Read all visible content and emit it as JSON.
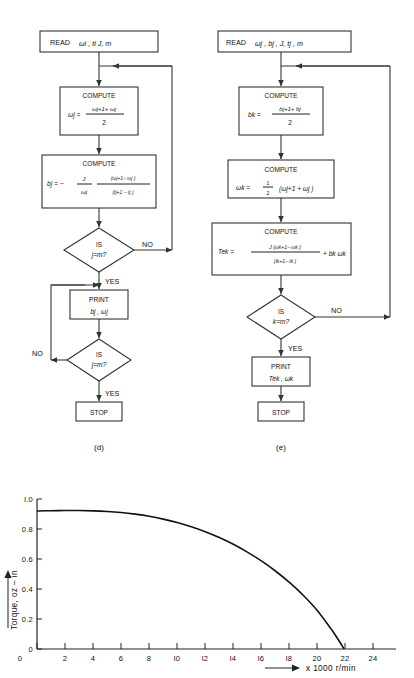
{
  "figure": {
    "panels": [
      {
        "id": "d",
        "caption": "(d)",
        "nodes": {
          "read": "READ",
          "read_args": "ωi , ti   J, m",
          "compute1_title": "COMPUTE",
          "compute1_lhs": "ωj =",
          "compute1_num": "ωj+1+ ωj",
          "compute1_den": "2",
          "compute2_title": "COMPUTE",
          "compute2_lhs": "bj = −",
          "compute2_f1_num": "J",
          "compute2_f1_den": "ωj",
          "compute2_f2_num": "(ωj+1− ωj )",
          "compute2_f2_den": "(tj+1 − tj )",
          "decision1_l1": "IS",
          "decision1_l2": "j=m?",
          "decision1_no": "NO",
          "decision1_yes": "YES",
          "print_title": "PRINT",
          "print_args": "bj , ωj",
          "decision2_l1": "IS",
          "decision2_l2": "j=m?",
          "decision2_no": "NO",
          "decision2_yes": "YES",
          "stop": "STOP"
        }
      },
      {
        "id": "e",
        "caption": "(e)",
        "nodes": {
          "read": "READ",
          "read_args": "ωj , bj ,  J,  tj , m",
          "compute1_title": "COMPUTE",
          "compute1_lhs": "bk =",
          "compute1_num": "bj+1+ bj",
          "compute1_den": "2",
          "compute2_title": "COMPUTE",
          "compute2_lhs": "ωk =",
          "compute2_half_num": "1",
          "compute2_half_den": "2",
          "compute2_rhs": "(ωj+1 + ωj )",
          "compute3_title": "COMPUTE",
          "compute3_lhs": "Tek =",
          "compute3_num": "J (ωk+1− ωk )",
          "compute3_den": "(tk+1− tk )",
          "compute3_tail": "+ bk ωk",
          "decision_l1": "IS",
          "decision_l2": "k=m?",
          "decision_no": "NO",
          "decision_yes": "YES",
          "print_title": "PRINT",
          "print_args": "Tek , ωk",
          "stop": "STOP"
        }
      }
    ]
  },
  "chart_data": {
    "type": "line",
    "title": "",
    "xlabel": "x 1000 r/min",
    "ylabel": "Torque, oz – in",
    "xlim": [
      0,
      25.6
    ],
    "ylim": [
      0,
      1.08
    ],
    "grid": false,
    "legend": null,
    "x_ticks": [
      0,
      2,
      4,
      6,
      8,
      10,
      12,
      14,
      16,
      18,
      20,
      22,
      24
    ],
    "x_tick_labels": [
      "0",
      "2",
      "4",
      "6",
      "8",
      "l0",
      "l2",
      "l4",
      "l6",
      "l8",
      "20",
      "22",
      "24"
    ],
    "y_ticks": [
      0,
      0.2,
      0.4,
      0.6,
      0.8,
      1.0
    ],
    "y_tick_labels": [
      "0",
      "0.2",
      "0.4",
      "0.6",
      "0.8",
      "l.0"
    ],
    "series": [
      {
        "name": "torque-speed curve",
        "x": [
          0,
          1,
          2,
          3,
          4,
          5,
          6,
          7,
          8,
          9,
          10,
          11,
          12,
          13,
          14,
          15,
          16,
          17,
          18,
          19,
          20,
          21,
          21.5,
          21.9
        ],
        "y": [
          0.92,
          0.922,
          0.923,
          0.923,
          0.921,
          0.917,
          0.91,
          0.899,
          0.885,
          0.866,
          0.843,
          0.815,
          0.782,
          0.743,
          0.698,
          0.646,
          0.587,
          0.52,
          0.444,
          0.357,
          0.255,
          0.13,
          0.06,
          0.0
        ]
      }
    ]
  }
}
